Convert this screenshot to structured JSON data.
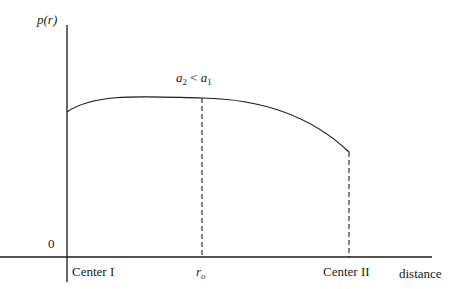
{
  "diagram": {
    "y_axis_label": "p(r)",
    "origin_label": "0",
    "x_axis_label": "distance",
    "annotation": {
      "a_left": "a",
      "a_left_sub": "2",
      "relation": " < ",
      "a_right": "a",
      "a_right_sub": "1"
    },
    "ticks": {
      "center1": "Center I",
      "r0_main": "r",
      "r0_sub": "o",
      "center2": "Center II"
    },
    "colors": {
      "ink": "#1a1a1a",
      "background": "#ffffff"
    }
  }
}
